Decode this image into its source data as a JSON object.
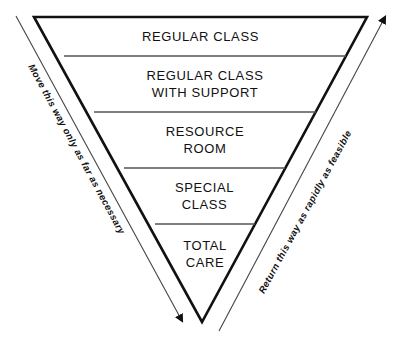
{
  "diagram": {
    "type": "inverted-pyramid",
    "background_color": "#ffffff",
    "outline_color": "#111111",
    "divider_color": "#555555",
    "text_color": "#111111",
    "bands": [
      {
        "id": "regular-class",
        "label": "REGULAR CLASS",
        "level": 1
      },
      {
        "id": "regular-class-with-support",
        "label": "REGULAR CLASS\nWITH SUPPORT",
        "level": 2
      },
      {
        "id": "resource-room",
        "label": "RESOURCE\nROOM",
        "level": 3
      },
      {
        "id": "special-class",
        "label": "SPECIAL\nCLASS",
        "level": 4
      },
      {
        "id": "total-care",
        "label": "TOTAL\nCARE",
        "level": 5
      }
    ],
    "annotations": {
      "left_arrow": {
        "text": "Move this way only as far as necessary",
        "direction": "down"
      },
      "right_arrow": {
        "text": "Return this way as rapidly as feasible",
        "direction": "up"
      }
    }
  }
}
